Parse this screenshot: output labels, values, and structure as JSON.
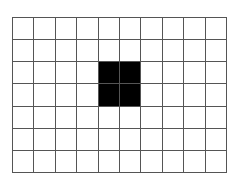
{
  "grid": {
    "rows": 7,
    "cols": 10,
    "line_color": "#555555",
    "background_color": "#ffffff",
    "fill_color": "#000000",
    "filled_cells": [
      {
        "row": 2,
        "col": 4
      },
      {
        "row": 2,
        "col": 5
      },
      {
        "row": 3,
        "col": 4
      },
      {
        "row": 3,
        "col": 5
      }
    ]
  }
}
